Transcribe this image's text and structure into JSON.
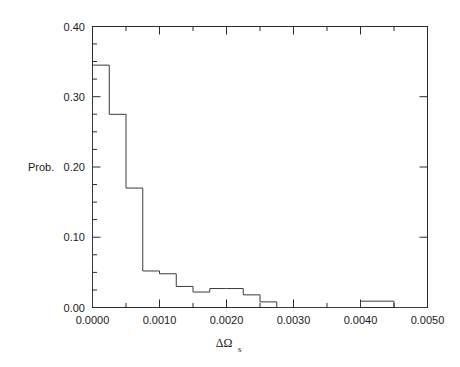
{
  "chart_data": {
    "type": "bar",
    "title": "",
    "subtitle": "",
    "xlabel": "ΔΩ",
    "xlabel_subscript": "s",
    "ylabel": "Prob.",
    "xlim": [
      0.0,
      0.005
    ],
    "ylim": [
      0.0,
      0.4
    ],
    "grid": false,
    "legend": null,
    "style": "step-histogram-outline",
    "bin_width": 0.00025,
    "bin_edges": [
      0.0,
      0.00025,
      0.0005,
      0.00075,
      0.001,
      0.00125,
      0.0015,
      0.00175,
      0.002,
      0.00225,
      0.0025,
      0.00275,
      0.003,
      0.00325,
      0.0035,
      0.00375,
      0.004,
      0.00425,
      0.0045,
      0.00475,
      0.005
    ],
    "categories": [
      "0.00000-0.00025",
      "0.00025-0.00050",
      "0.00050-0.00075",
      "0.00075-0.00100",
      "0.00100-0.00125",
      "0.00125-0.00150",
      "0.00150-0.00175",
      "0.00175-0.00200",
      "0.00200-0.00225",
      "0.00225-0.00250",
      "0.00250-0.00275",
      "0.00275-0.00300",
      "0.00300-0.00325",
      "0.00325-0.00350",
      "0.00350-0.00375",
      "0.00375-0.00400",
      "0.00400-0.00425",
      "0.00425-0.00450",
      "0.00450-0.00475",
      "0.00475-0.00500"
    ],
    "values": [
      0.345,
      0.275,
      0.17,
      0.052,
      0.048,
      0.03,
      0.022,
      0.027,
      0.027,
      0.018,
      0.008,
      0.0,
      0.0,
      0.0,
      0.0,
      0.0,
      0.009,
      0.009,
      0.0,
      0.0
    ],
    "xticks": [
      0.0,
      0.001,
      0.002,
      0.003,
      0.004,
      0.005
    ],
    "xticklabels": [
      "0.0000",
      "0.0010",
      "0.0020",
      "0.0030",
      "0.0040",
      "0.0050"
    ],
    "xminor_step": 0.00025,
    "yticks": [
      0.0,
      0.1,
      0.2,
      0.3,
      0.4
    ],
    "yticklabels": [
      "0.00",
      "0.10",
      "0.20",
      "0.30",
      "0.40"
    ],
    "yminor_step": 0.025,
    "colors": {
      "background": "#ffffff",
      "line": "#3a3a3a",
      "axis": "#2b2b2b",
      "text": "#1a1a1a"
    }
  }
}
